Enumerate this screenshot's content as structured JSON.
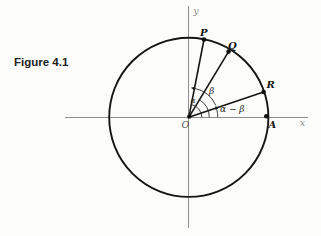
{
  "caption": "Figure 4.1",
  "labels": {
    "x_axis": "x",
    "y_axis": "y",
    "origin": "O",
    "point_p": "P",
    "point_q": "Q",
    "point_r": "R",
    "point_a": "A",
    "angle_alpha": "α",
    "angle_beta": "β",
    "angle_alpha_minus_beta": "α − β"
  },
  "geometry": {
    "description": "Circle centered at origin O with radius points P, Q, R, A marked by dots; angle arcs with arrowheads drawn from the positive x-axis",
    "point_angles_deg": {
      "P": 79,
      "Q": 59,
      "R": 19,
      "A": 0
    },
    "colors": {
      "ink": "#151515",
      "axis": "#8e8e8e",
      "background": "#fcfcfa"
    }
  }
}
